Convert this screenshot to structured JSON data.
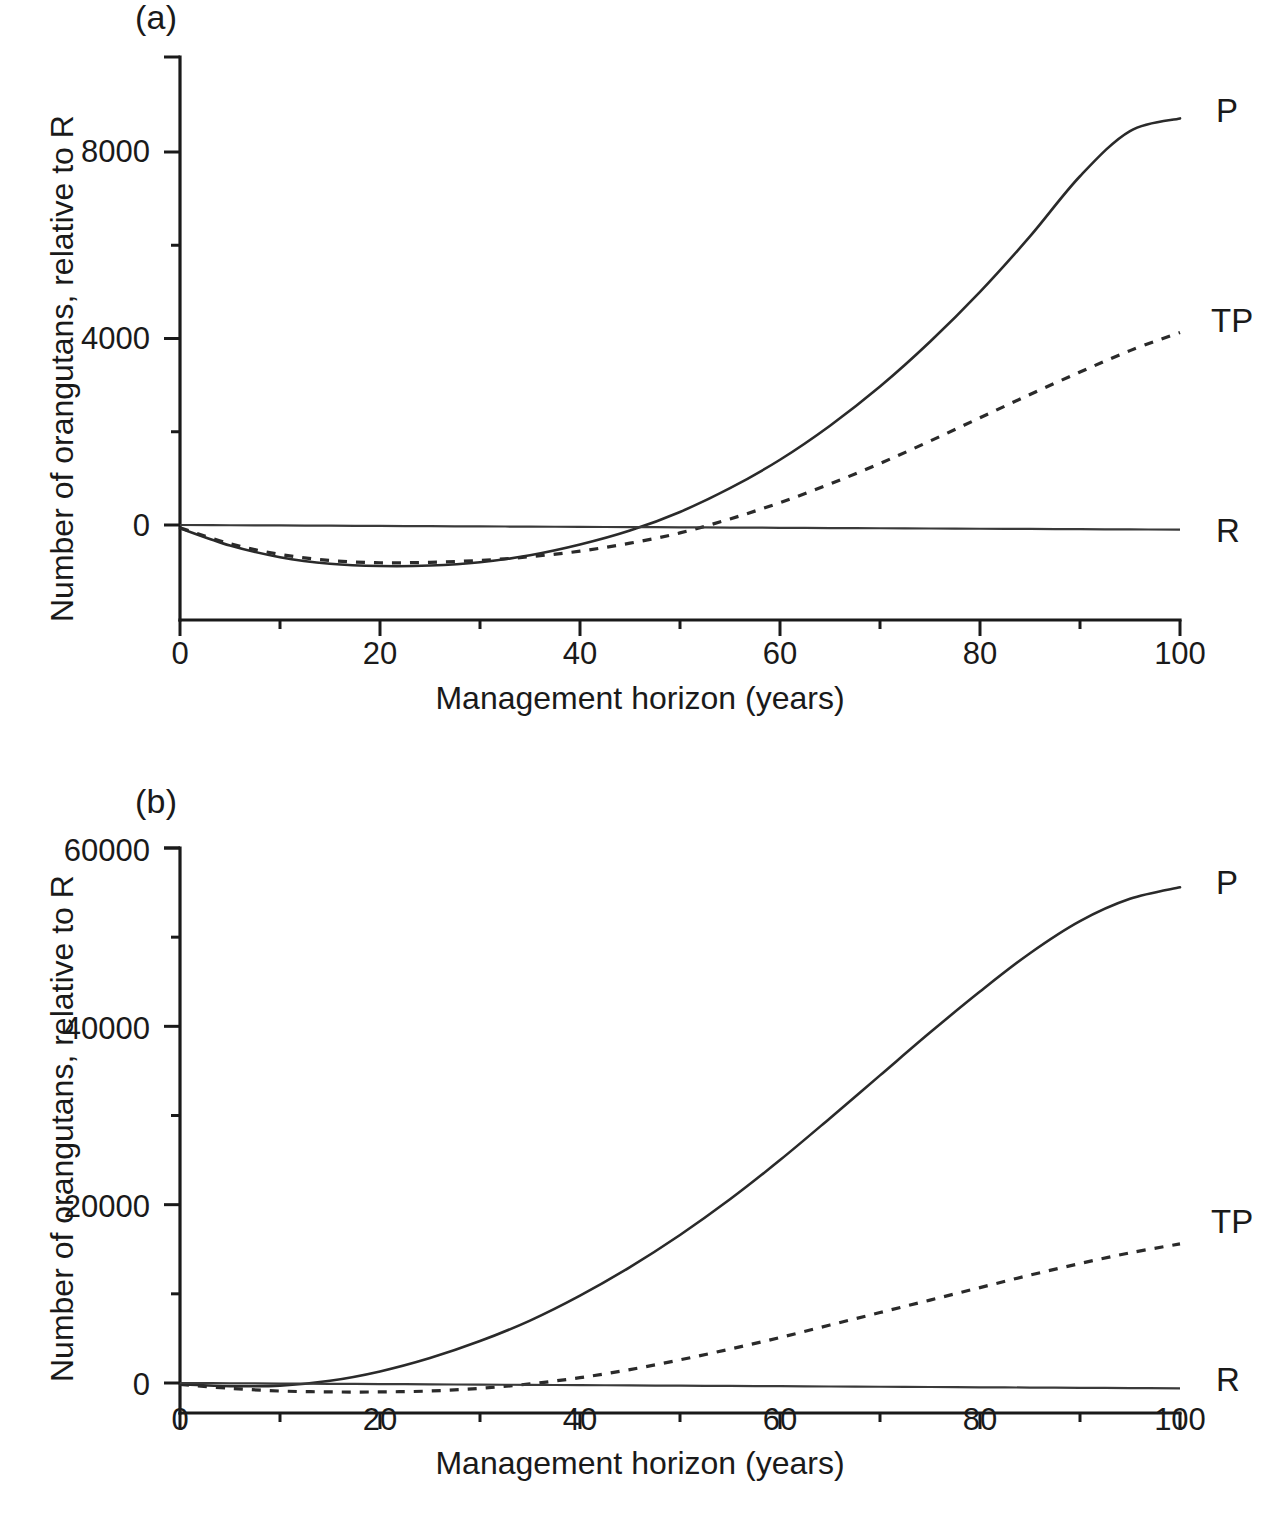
{
  "figure": {
    "panels": [
      {
        "tag": "(a)",
        "xlabel": "Management horizon (years)",
        "ylabel": "Number of orangutans, relative to R",
        "xticks": [
          "0",
          "20",
          "40",
          "60",
          "80",
          "100"
        ],
        "yticks": [
          "0",
          "4000",
          "8000"
        ],
        "series_labels": [
          "P",
          "TP",
          "R"
        ]
      },
      {
        "tag": "(b)",
        "xlabel": "Management horizon (years)",
        "ylabel": "Number of orangutans, relative to R",
        "xticks": [
          "0",
          "20",
          "40",
          "60",
          "80",
          "100"
        ],
        "yticks": [
          "0",
          "20000",
          "40000",
          "60000"
        ],
        "series_labels": [
          "P",
          "TP",
          "R"
        ]
      }
    ]
  },
  "chart_data": [
    {
      "type": "line",
      "panel": "(a)",
      "title": "",
      "xlabel": "Management horizon (years)",
      "ylabel": "Number of orangutans, relative to R",
      "xlim": [
        0,
        100
      ],
      "ylim": [
        -1500,
        9700
      ],
      "xticks": [
        0,
        20,
        40,
        60,
        80,
        100
      ],
      "xticks_minor": [
        10,
        30,
        50,
        70,
        90
      ],
      "yticks": [
        0,
        4000,
        8000
      ],
      "yticks_minor": [
        2000,
        6000
      ],
      "grid": false,
      "legend_position": "right-of-axes inline labels",
      "x": [
        0,
        5,
        10,
        15,
        20,
        25,
        30,
        35,
        40,
        45,
        50,
        55,
        60,
        65,
        70,
        75,
        80,
        85,
        90,
        95,
        100
      ],
      "series": [
        {
          "name": "P",
          "style": "solid",
          "values": [
            -70,
            -440,
            -690,
            -830,
            -880,
            -870,
            -800,
            -650,
            -420,
            -120,
            280,
            790,
            1400,
            2130,
            2970,
            3930,
            5000,
            6190,
            7480,
            8450,
            8720
          ]
        },
        {
          "name": "TP",
          "style": "dashed",
          "values": [
            -60,
            -400,
            -630,
            -760,
            -810,
            -800,
            -760,
            -680,
            -560,
            -390,
            -170,
            130,
            480,
            880,
            1320,
            1800,
            2300,
            2800,
            3280,
            3740,
            4130
          ]
        },
        {
          "name": "R",
          "style": "solid-flat",
          "values": [
            0,
            -5,
            -10,
            -15,
            -20,
            -25,
            -30,
            -35,
            -40,
            -45,
            -50,
            -55,
            -60,
            -65,
            -70,
            -75,
            -80,
            -85,
            -90,
            -95,
            -100
          ]
        }
      ]
    },
    {
      "type": "line",
      "panel": "(b)",
      "title": "",
      "xlabel": "Management horizon (years)",
      "ylabel": "Number of orangutans, relative to R",
      "xlim": [
        0,
        100
      ],
      "ylim": [
        -4000,
        62500
      ],
      "xticks": [
        0,
        20,
        40,
        60,
        80,
        100
      ],
      "xticks_minor": [
        10,
        30,
        50,
        70,
        90
      ],
      "yticks": [
        0,
        20000,
        40000,
        60000
      ],
      "yticks_minor": [
        10000,
        30000,
        50000
      ],
      "grid": false,
      "legend_position": "right-of-axes inline labels",
      "x": [
        0,
        5,
        10,
        15,
        20,
        25,
        30,
        35,
        40,
        45,
        50,
        55,
        60,
        65,
        70,
        75,
        80,
        85,
        90,
        95,
        100
      ],
      "series": [
        {
          "name": "P",
          "style": "solid",
          "values": [
            -150,
            -350,
            -300,
            250,
            1300,
            2800,
            4700,
            7000,
            9800,
            13000,
            16600,
            20600,
            25000,
            29700,
            34500,
            39300,
            43900,
            48200,
            51800,
            54300,
            55600
          ]
        },
        {
          "name": "TP",
          "style": "dashed",
          "values": [
            -150,
            -600,
            -900,
            -1000,
            -1000,
            -900,
            -600,
            -100,
            600,
            1500,
            2600,
            3800,
            5100,
            6500,
            7900,
            9300,
            10700,
            12100,
            13400,
            14600,
            15600
          ]
        },
        {
          "name": "R",
          "style": "solid-flat",
          "values": [
            0,
            -30,
            -60,
            -90,
            -120,
            -150,
            -180,
            -210,
            -240,
            -270,
            -300,
            -330,
            -360,
            -390,
            -420,
            -450,
            -480,
            -510,
            -540,
            -570,
            -600
          ]
        }
      ]
    }
  ]
}
